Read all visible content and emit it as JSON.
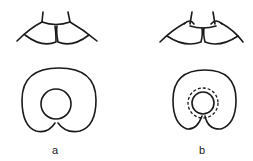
{
  "figure": {
    "panels": [
      {
        "id": "a",
        "label": "a"
      },
      {
        "id": "b",
        "label": "b"
      }
    ],
    "colors": {
      "line": "#1a1a1a",
      "background": "#ffffff"
    }
  }
}
